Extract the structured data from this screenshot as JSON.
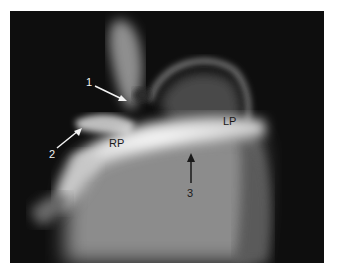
{
  "figure": {
    "labels": {
      "arrow1": "1",
      "arrow2": "2",
      "arrow3": "3",
      "rp": "RP",
      "lp": "LP"
    },
    "colors": {
      "background": "#0e0e0e",
      "contrast_bright": "#f0f0f0",
      "tissue_gray": "#8a8a8a",
      "white_arrow": "#f2f2f2",
      "black_arrow": "#1a1a1a"
    }
  }
}
